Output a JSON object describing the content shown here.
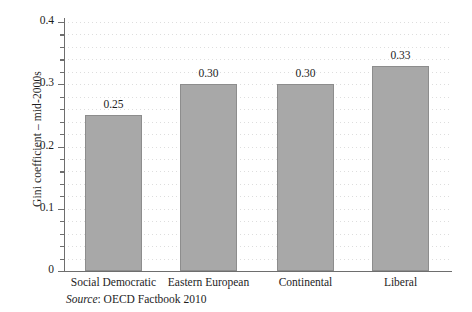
{
  "chart_data": {
    "type": "bar",
    "title": "",
    "xlabel": "",
    "ylabel": "Gini coefficient – mid-2000s",
    "ylim": [
      0,
      0.4
    ],
    "grid": true,
    "legend": "none",
    "categories": [
      "Social Democratic",
      "Eastern European",
      "Continental",
      "Liberal"
    ],
    "values": [
      0.25,
      0.3,
      0.3,
      0.33
    ],
    "value_labels": [
      "0.25",
      "0.30",
      "0.30",
      "0.33"
    ],
    "y_ticks_major": [
      {
        "value": 0,
        "label": "0"
      },
      {
        "value": 0.1,
        "label": "0.1"
      },
      {
        "value": 0.2,
        "label": "0.2"
      },
      {
        "value": 0.3,
        "label": "0.3"
      },
      {
        "value": 0.4,
        "label": "0.4"
      }
    ],
    "y_ticks_minor": [
      0.02,
      0.04,
      0.06,
      0.08,
      0.12,
      0.14,
      0.16,
      0.18,
      0.22,
      0.24,
      0.26,
      0.28,
      0.32,
      0.34,
      0.36,
      0.38
    ],
    "gridline_step": 0.02,
    "colors": {
      "bar_fill": "#a8a8a8",
      "bar_border": "#8d8d8d",
      "axis": "#6e6e6e",
      "gridline": "#d8d8d8",
      "text": "#1d1d1d",
      "background": "#ffffff"
    }
  },
  "source": {
    "label": "Source",
    "separator": ": ",
    "text": "OECD Factbook 2010"
  }
}
